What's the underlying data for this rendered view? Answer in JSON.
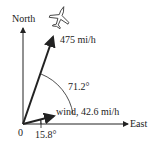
{
  "labels": {
    "north": "North",
    "east": "East",
    "origin": "0",
    "plane_speed": "475 mi/h",
    "angle_between": "71.2°",
    "wind": "wind, 42.6 mi/h",
    "wind_angle": "15.8°"
  },
  "vectors": {
    "plane": {
      "magnitude": "475 mi/h"
    },
    "wind": {
      "magnitude": "42.6 mi/h",
      "angle_from_east": "15.8°"
    }
  }
}
